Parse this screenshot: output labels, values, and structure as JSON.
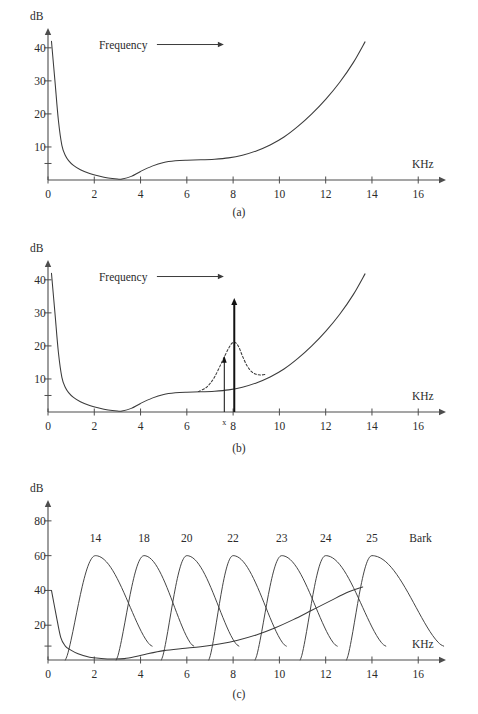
{
  "figure": {
    "caption": "Figure 5.4: The sliding of Masking effect.",
    "panel_labels": [
      "(a)",
      "(b)",
      "(c)"
    ]
  },
  "chart_data": [
    {
      "id": "panel-a",
      "type": "line",
      "title": "",
      "panel_label": "(a)",
      "xlabel": "KHz",
      "ylabel": "dB",
      "xlim": [
        0,
        17.2
      ],
      "ylim": [
        0,
        46
      ],
      "grid": false,
      "legend": "none",
      "xticks": [
        0,
        2,
        4,
        6,
        8,
        10,
        12,
        14,
        16
      ],
      "xticklabels": [
        "0",
        "2",
        "4",
        "6",
        "8",
        "10",
        "12",
        "14",
        "16"
      ],
      "yticks": [
        5,
        10,
        20,
        30,
        40
      ],
      "yticklabels": [
        "",
        "10",
        "20",
        "30",
        "40"
      ],
      "annotations": [
        {
          "name": "frequency-arrow",
          "text": "Frequency",
          "x": 2.2,
          "y": 41,
          "arrow_to_x": 7.6
        }
      ],
      "series": [
        {
          "name": "absolute-threshold-of-hearing",
          "style": "solid",
          "x": [
            0.15,
            0.3,
            0.45,
            0.6,
            0.75,
            0.9,
            1.1,
            1.4,
            1.8,
            2.2,
            2.6,
            3.0,
            3.2,
            3.6,
            4.0,
            4.5,
            5.0,
            5.5,
            6.0,
            6.6,
            7.2,
            7.8,
            8.4,
            9.0,
            9.6,
            10.2,
            10.8,
            11.4,
            12.0,
            12.6,
            13.2,
            13.7
          ],
          "y": [
            42.0,
            30.0,
            18.0,
            10.5,
            7.4,
            5.8,
            4.4,
            3.1,
            2.0,
            1.2,
            0.6,
            0.3,
            0.3,
            1.1,
            2.6,
            4.2,
            5.3,
            5.8,
            6.0,
            6.1,
            6.3,
            6.7,
            7.5,
            8.8,
            10.6,
            13.0,
            16.2,
            20.0,
            24.4,
            29.5,
            35.6,
            41.8
          ]
        }
      ]
    },
    {
      "id": "panel-b",
      "type": "line",
      "title": "",
      "panel_label": "(b)",
      "xlabel": "KHz",
      "ylabel": "dB",
      "xlim": [
        0,
        17.2
      ],
      "ylim": [
        0,
        46
      ],
      "grid": false,
      "legend": "none",
      "xticks": [
        0,
        2,
        4,
        6,
        8,
        10,
        12,
        14,
        16
      ],
      "xticklabels": [
        "0",
        "2",
        "4",
        "6",
        "8",
        "10",
        "12",
        "14",
        "16"
      ],
      "yticks": [
        5,
        10,
        20,
        30,
        40
      ],
      "yticklabels": [
        "",
        "10",
        "20",
        "30",
        "40"
      ],
      "annotations": [
        {
          "name": "frequency-arrow",
          "text": "Frequency",
          "x": 2.2,
          "y": 41,
          "arrow_to_x": 7.6
        },
        {
          "name": "masked-tone-mark",
          "text": "x",
          "x": 7.62,
          "y": -1.6
        }
      ],
      "markers": [
        {
          "name": "tonal-masker-arrow",
          "style": "bold",
          "x": 8.05,
          "y_from": 0,
          "y_to": 34.5
        },
        {
          "name": "masked-tone-arrow",
          "style": "thin",
          "x": 7.62,
          "y_from": 0,
          "y_to": 17.0
        }
      ],
      "series": [
        {
          "name": "absolute-threshold-of-hearing",
          "style": "solid",
          "x": [
            0.15,
            0.3,
            0.45,
            0.6,
            0.75,
            0.9,
            1.1,
            1.4,
            1.8,
            2.2,
            2.6,
            3.0,
            3.2,
            3.6,
            4.0,
            4.5,
            5.0,
            5.5,
            6.0,
            6.6,
            7.2,
            7.8,
            8.4,
            9.0,
            9.6,
            10.2,
            10.8,
            11.4,
            12.0,
            12.6,
            13.2,
            13.7
          ],
          "y": [
            42.0,
            30.0,
            18.0,
            10.5,
            7.4,
            5.8,
            4.4,
            3.1,
            2.0,
            1.2,
            0.6,
            0.3,
            0.3,
            1.1,
            2.6,
            4.2,
            5.3,
            5.8,
            6.0,
            6.1,
            6.3,
            6.7,
            7.5,
            8.8,
            10.6,
            13.0,
            16.2,
            20.0,
            24.4,
            29.5,
            35.6,
            41.8
          ]
        },
        {
          "name": "masking-threshold",
          "style": "dashed",
          "x": [
            6.5,
            6.8,
            7.0,
            7.2,
            7.4,
            7.6,
            7.8,
            7.95,
            8.1,
            8.25,
            8.4,
            8.6,
            8.8,
            9.0,
            9.2,
            9.4
          ],
          "y": [
            6.2,
            7.2,
            8.6,
            10.6,
            13.4,
            16.4,
            19.2,
            20.8,
            21.0,
            19.6,
            17.0,
            14.0,
            12.2,
            11.4,
            11.2,
            11.4
          ]
        }
      ]
    },
    {
      "id": "panel-c",
      "type": "line",
      "title": "",
      "panel_label": "(c)",
      "xlabel": "KHz",
      "ylabel": "dB",
      "legend_label": "Bark",
      "xlim": [
        0,
        17.2
      ],
      "ylim": [
        0,
        92
      ],
      "grid": false,
      "legend": "inline-top",
      "xticks": [
        0,
        2,
        4,
        6,
        8,
        10,
        12,
        14,
        16
      ],
      "xticklabels": [
        "0",
        "2",
        "4",
        "6",
        "8",
        "10",
        "12",
        "14",
        "16"
      ],
      "yticks": [
        8,
        20,
        40,
        60,
        80
      ],
      "yticklabels": [
        "",
        "20",
        "40",
        "60",
        "80"
      ],
      "bark_labels": [
        "14",
        "18",
        "20",
        "22",
        "23",
        "24",
        "25"
      ],
      "bark_label_x": [
        2.05,
        4.15,
        6.0,
        8.0,
        10.1,
        12.0,
        14.0
      ],
      "bark_label_y": 68,
      "bark_bands": [
        {
          "name": "bark-band-14",
          "number": "14",
          "onset": 0.75,
          "peak_x": 2.05,
          "peak_y": 60,
          "end_x": 4.5,
          "end_y": 8
        },
        {
          "name": "bark-band-18",
          "number": "18",
          "onset": 2.95,
          "peak_x": 4.15,
          "peak_y": 60,
          "end_x": 6.3,
          "end_y": 8
        },
        {
          "name": "bark-band-20",
          "number": "20",
          "onset": 4.9,
          "peak_x": 6.0,
          "peak_y": 60,
          "end_x": 8.25,
          "end_y": 8
        },
        {
          "name": "bark-band-22",
          "number": "22",
          "onset": 6.95,
          "peak_x": 8.0,
          "peak_y": 60,
          "end_x": 10.3,
          "end_y": 8
        },
        {
          "name": "bark-band-23",
          "number": "23",
          "onset": 8.95,
          "peak_x": 10.1,
          "peak_y": 60,
          "end_x": 12.5,
          "end_y": 8
        },
        {
          "name": "bark-band-24",
          "number": "24",
          "onset": 10.9,
          "peak_x": 12.0,
          "peak_y": 60,
          "end_x": 14.6,
          "end_y": 8
        },
        {
          "name": "bark-band-25",
          "number": "25",
          "onset": 12.9,
          "peak_x": 14.0,
          "peak_y": 60,
          "end_x": 17.1,
          "end_y": 8
        }
      ],
      "series": [
        {
          "name": "absolute-threshold-of-hearing",
          "style": "solid",
          "x": [
            0.15,
            0.35,
            0.55,
            0.75,
            0.95,
            1.3,
            1.8,
            2.3,
            2.8,
            3.3,
            3.8,
            4.3,
            5.0,
            5.8,
            6.6,
            7.4,
            8.2,
            9.0,
            9.8,
            10.6,
            11.4,
            12.2,
            13.0,
            13.6
          ],
          "y": [
            40.0,
            26.0,
            13.0,
            8.0,
            6.0,
            3.6,
            1.6,
            0.9,
            0.6,
            0.8,
            2.0,
            3.6,
            5.4,
            6.6,
            7.6,
            9.2,
            11.4,
            14.4,
            18.4,
            23.2,
            28.6,
            34.0,
            39.2,
            42.0
          ]
        }
      ]
    }
  ]
}
